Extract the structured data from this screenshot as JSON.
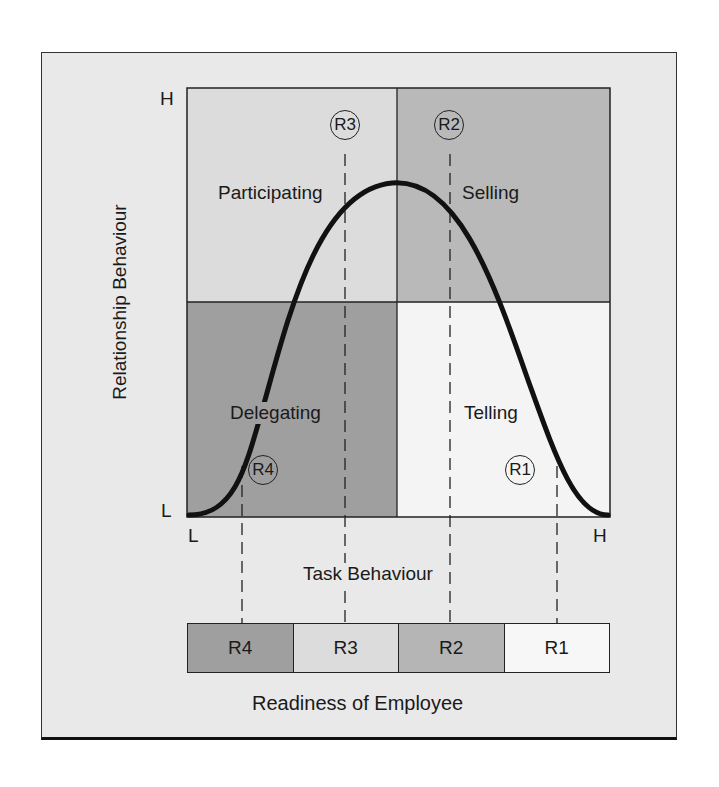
{
  "diagram": {
    "y_axis": {
      "label": "Relationship Behaviour",
      "high": "H",
      "low": "L"
    },
    "x_axis": {
      "label": "Task Behaviour",
      "low": "L",
      "high": "H"
    },
    "quadrants": [
      {
        "id": "participating",
        "label": "Participating",
        "readiness": "R3",
        "position": "top-left",
        "color": "#dcdcdc"
      },
      {
        "id": "selling",
        "label": "Selling",
        "readiness": "R2",
        "position": "top-right",
        "color": "#b9b9b9"
      },
      {
        "id": "delegating",
        "label": "Delegating",
        "readiness": "R4",
        "position": "bottom-left",
        "color": "#9f9f9f"
      },
      {
        "id": "telling",
        "label": "Telling",
        "readiness": "R1",
        "position": "bottom-right",
        "color": "#f4f4f4"
      }
    ],
    "readiness_bar": {
      "label": "Readiness of Employee",
      "segments": [
        {
          "label": "R4",
          "color": "#9f9f9f"
        },
        {
          "label": "R3",
          "color": "#dcdcdc"
        },
        {
          "label": "R2",
          "color": "#b5b5b5"
        },
        {
          "label": "R1",
          "color": "#f7f7f7"
        }
      ]
    }
  }
}
